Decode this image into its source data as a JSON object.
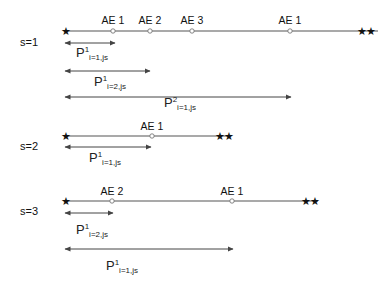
{
  "figure": {
    "background": "#ffffff",
    "line_color": "#555555",
    "arrow_color": "#444444",
    "marker_fill": "#ffffff",
    "marker_stroke": "#777777",
    "start_marker_glyph": "★",
    "end_marker_glyph": "★★"
  },
  "rows": [
    {
      "id": "s1",
      "label": "s=1",
      "label_x": 20,
      "label_y": 36,
      "axis": {
        "y": 31,
        "x_start": 65,
        "x_end": 378
      },
      "start_marker": {
        "x": 65,
        "y": 31,
        "name": "start-star-s1"
      },
      "end_marker": {
        "x": 366,
        "y": 31,
        "name": "end-double-star-s1"
      },
      "events": [
        {
          "label": "AE 1",
          "x": 113,
          "label_x": 113,
          "label_y": 14
        },
        {
          "label": "AE 2",
          "x": 150,
          "label_x": 150,
          "label_y": 14
        },
        {
          "label": "AE 3",
          "x": 192,
          "label_x": 192,
          "label_y": 14
        },
        {
          "label": "AE 1",
          "x": 290,
          "label_x": 290,
          "label_y": 14
        }
      ],
      "intervals": [
        {
          "name": "interval-s1-p1-i1",
          "y": 43,
          "x_start": 65,
          "x_end": 115,
          "base": "P",
          "sup": "1",
          "sub": "i=1,js",
          "label_x": 92,
          "label_y": 46
        },
        {
          "name": "interval-s1-p1-i2",
          "y": 71,
          "x_start": 65,
          "x_end": 150,
          "base": "P",
          "sup": "1",
          "sub": "i=2,js",
          "label_x": 110,
          "label_y": 75
        },
        {
          "name": "interval-s1-p2-i1",
          "y": 97,
          "x_start": 65,
          "x_end": 291,
          "base": "P",
          "sup": "2",
          "sub": "i=1,js",
          "label_x": 180,
          "label_y": 96
        }
      ]
    },
    {
      "id": "s2",
      "label": "s=2",
      "label_x": 20,
      "label_y": 140,
      "axis": {
        "y": 136,
        "x_start": 65,
        "x_end": 230
      },
      "start_marker": {
        "x": 65,
        "y": 136,
        "name": "start-star-s2"
      },
      "end_marker": {
        "x": 224,
        "y": 136,
        "name": "end-double-star-s2"
      },
      "events": [
        {
          "label": "AE 1",
          "x": 152,
          "label_x": 152,
          "label_y": 120
        }
      ],
      "intervals": [
        {
          "name": "interval-s2-p1-i1",
          "y": 147,
          "x_start": 65,
          "x_end": 151,
          "base": "P",
          "sup": "1",
          "sub": "i=1,js",
          "label_x": 105,
          "label_y": 151
        }
      ]
    },
    {
      "id": "s3",
      "label": "s=3",
      "label_x": 20,
      "label_y": 205,
      "axis": {
        "y": 201,
        "x_start": 65,
        "x_end": 318
      },
      "start_marker": {
        "x": 65,
        "y": 201,
        "name": "start-star-s3"
      },
      "end_marker": {
        "x": 310,
        "y": 201,
        "name": "end-double-star-s3"
      },
      "events": [
        {
          "label": "AE 2",
          "x": 112,
          "label_x": 112,
          "label_y": 185
        },
        {
          "label": "AE 1",
          "x": 232,
          "label_x": 232,
          "label_y": 185
        }
      ],
      "intervals": [
        {
          "name": "interval-s3-p1-i2",
          "y": 213,
          "x_start": 65,
          "x_end": 113,
          "base": "P",
          "sup": "1",
          "sub": "i=2,js",
          "label_x": 92,
          "label_y": 223
        },
        {
          "name": "interval-s3-p1-i1",
          "y": 249,
          "x_start": 65,
          "x_end": 233,
          "base": "P",
          "sup": "1",
          "sub": "i=1,js",
          "label_x": 122,
          "label_y": 259
        }
      ]
    }
  ]
}
